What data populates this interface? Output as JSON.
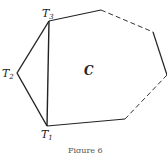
{
  "figure": {
    "caption": "Figure 6",
    "region_label": "C",
    "vertices": {
      "T1": {
        "label": "T",
        "sub": "1"
      },
      "T2": {
        "label": "T",
        "sub": "2"
      },
      "T3": {
        "label": "T",
        "sub": "3"
      }
    },
    "colors": {
      "line": "#222222",
      "background": "#ffffff"
    }
  }
}
